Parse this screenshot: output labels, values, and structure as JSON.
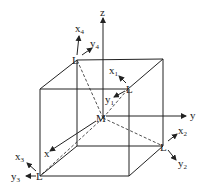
{
  "diagram": {
    "center_label": "M",
    "axes": {
      "x": "x",
      "y": "y",
      "z": "z"
    },
    "ligands": [
      {
        "id": 1,
        "label": "L",
        "local_axes": [
          "x",
          "y"
        ],
        "subscript": "1"
      },
      {
        "id": 2,
        "label": "L",
        "local_axes": [
          "x",
          "y"
        ],
        "subscript": "2"
      },
      {
        "id": 3,
        "label": "L",
        "local_axes": [
          "x",
          "y"
        ],
        "subscript": "3"
      },
      {
        "id": 4,
        "label": "L",
        "local_axes": [
          "x",
          "y"
        ],
        "subscript": "4"
      }
    ],
    "colors": {
      "line": "#222222",
      "background": "#ffffff"
    }
  }
}
